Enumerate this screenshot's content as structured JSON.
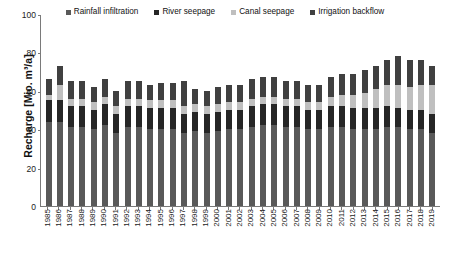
{
  "chart_data": {
    "type": "bar",
    "stacked": true,
    "title": "",
    "xlabel": "",
    "ylabel": "Recharge [Mio. m³/a]",
    "ylim": [
      0,
      100
    ],
    "yticks": [
      0,
      20,
      40,
      60,
      80,
      100
    ],
    "grid": false,
    "legend_position": "top-center",
    "categories": [
      "1985",
      "1986",
      "1987",
      "1988",
      "1989",
      "1990",
      "1991",
      "1992",
      "1993",
      "1994",
      "1995",
      "1996",
      "1997",
      "1998",
      "1999",
      "2000",
      "2001",
      "2002",
      "2003",
      "2004",
      "2005",
      "2006",
      "2007",
      "2008",
      "2009",
      "2010",
      "2011",
      "2012",
      "2013",
      "2014",
      "2015",
      "2016",
      "2017",
      "2018",
      "2019"
    ],
    "series": [
      {
        "name": "Rainfall infiltration",
        "color": "#595959",
        "values": [
          44,
          44,
          41,
          41,
          40,
          42,
          38,
          41,
          41,
          40,
          40,
          40,
          38,
          39,
          38,
          39,
          40,
          40,
          41,
          42,
          42,
          41,
          41,
          40,
          40,
          41,
          41,
          40,
          40,
          40,
          41,
          41,
          40,
          40,
          38
        ]
      },
      {
        "name": "River seepage",
        "color": "#262626",
        "values": [
          11,
          11,
          11,
          11,
          10,
          11,
          10,
          11,
          11,
          11,
          11,
          11,
          10,
          10,
          10,
          10,
          10,
          10,
          11,
          11,
          11,
          11,
          11,
          10,
          10,
          11,
          11,
          11,
          11,
          11,
          11,
          10,
          10,
          10,
          10
        ]
      },
      {
        "name": "Canal seepage",
        "color": "#bfbfbf",
        "values": [
          3,
          8,
          4,
          4,
          4,
          4,
          4,
          4,
          4,
          4,
          4,
          4,
          4,
          4,
          4,
          4,
          4,
          4,
          4,
          4,
          4,
          4,
          4,
          4,
          4,
          5,
          6,
          7,
          8,
          10,
          11,
          12,
          12,
          13,
          15
        ]
      },
      {
        "name": "Irrigation backflow",
        "color": "#404040",
        "values": [
          8,
          10,
          9,
          9,
          8,
          9,
          8,
          9,
          9,
          8,
          9,
          9,
          13,
          8,
          8,
          9,
          9,
          9,
          10,
          10,
          10,
          9,
          9,
          9,
          9,
          10,
          11,
          11,
          12,
          12,
          13,
          15,
          14,
          13,
          10
        ]
      }
    ]
  },
  "legend": {
    "items": [
      {
        "label": "Rainfall infiltration",
        "color": "#595959"
      },
      {
        "label": "River seepage",
        "color": "#262626"
      },
      {
        "label": "Canal seepage",
        "color": "#bfbfbf"
      },
      {
        "label": "Irrigation backflow",
        "color": "#404040"
      }
    ]
  },
  "axis": {
    "y_title": "Recharge [Mio. m³/a]",
    "y_labels": [
      "100",
      "80",
      "60",
      "40",
      "20",
      "0"
    ]
  }
}
